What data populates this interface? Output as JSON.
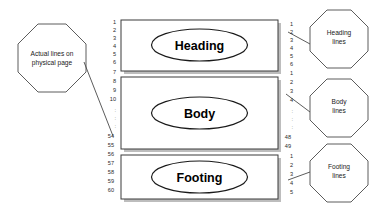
{
  "diagram": {
    "left_callout": {
      "label_line1": "Actual lines on",
      "label_line2": "physical page",
      "shape": "octagon"
    },
    "sections": [
      {
        "id": "heading",
        "label": "Heading",
        "shape": "ellipse-in-box"
      },
      {
        "id": "body",
        "label": "Body",
        "shape": "ellipse-in-box"
      },
      {
        "id": "footing",
        "label": "Footing",
        "shape": "ellipse-in-box"
      }
    ],
    "right_callouts": [
      {
        "id": "heading-lines",
        "label_line1": "Heading",
        "label_line2": "lines",
        "shape": "octagon"
      },
      {
        "id": "body-lines",
        "label_line1": "Body",
        "label_line2": "lines",
        "shape": "octagon"
      },
      {
        "id": "footing-lines",
        "label_line1": "Footing",
        "label_line2": "lines",
        "shape": "octagon"
      }
    ],
    "physical_line_numbers": [
      "1",
      "2",
      "3",
      "4",
      "5",
      "6",
      "7",
      "8",
      "9",
      "10",
      ":",
      ":",
      ":",
      "54",
      "55",
      "56",
      "57",
      "58",
      "59",
      "60"
    ],
    "logical_line_numbers": [
      "1",
      "2",
      "3",
      "4",
      "5",
      "6",
      "1",
      "2",
      "3",
      "4",
      ":",
      ":",
      ":",
      "48",
      "49",
      "1",
      "2",
      "3",
      "4",
      "5"
    ],
    "colors": {
      "outline": "#3a3a3a",
      "callout_outline": "#4a4a4a",
      "shadow": "#bdbdbd",
      "text": "#1a1a1a",
      "background": "#ffffff"
    }
  }
}
